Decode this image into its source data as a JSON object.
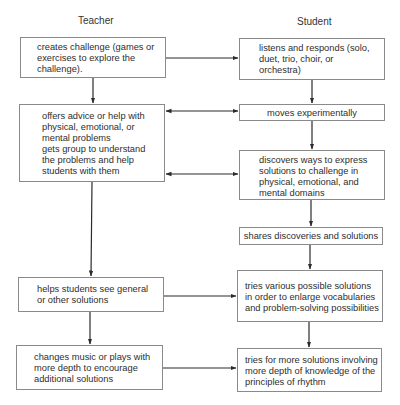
{
  "columns": {
    "teacher": "Teacher",
    "student": "Student"
  },
  "teacher_boxes": [
    {
      "id": "t1",
      "text": "creates challenge (games or\nexercises to explore the\nchallenge)."
    },
    {
      "id": "t2",
      "text": "offers advice or help with\nphysical, emotional, or\nmental problems\ngets group to understand\nthe problems and help\nstudents with them"
    },
    {
      "id": "t3",
      "text": "helps students see general\nor other solutions"
    },
    {
      "id": "t4",
      "text": "changes music or plays with\nmore depth to encourage\nadditional solutions"
    }
  ],
  "student_boxes": [
    {
      "id": "s1",
      "text": "listens and responds (solo,\nduet, trio, choir, or\norchestra)"
    },
    {
      "id": "s2",
      "text": "moves experimentally"
    },
    {
      "id": "s3",
      "text": "discovers ways to express\nsolutions to challenge in\nphysical, emotional, and\nmental domains"
    },
    {
      "id": "s4",
      "text": "shares discoveries and solutions"
    },
    {
      "id": "s5",
      "text": "tries various possible solutions\nin order to enlarge vocabularies\nand problem-solving possibilities"
    },
    {
      "id": "s6",
      "text": "tries for more solutions involving\nmore depth of knowledge of the\nprinciples of rhythm"
    }
  ],
  "connections": [
    {
      "from": "t1",
      "to": "t2",
      "type": "arrow"
    },
    {
      "from": "t2",
      "to": "t3",
      "type": "arrow"
    },
    {
      "from": "t3",
      "to": "t4",
      "type": "arrow"
    },
    {
      "from": "s1",
      "to": "s2",
      "type": "arrow"
    },
    {
      "from": "s2",
      "to": "s3",
      "type": "arrow"
    },
    {
      "from": "s3",
      "to": "s4",
      "type": "arrow"
    },
    {
      "from": "s4",
      "to": "s5",
      "type": "arrow"
    },
    {
      "from": "s5",
      "to": "s6",
      "type": "arrow"
    },
    {
      "from": "t1",
      "to": "s1",
      "type": "arrow"
    },
    {
      "from": "t2",
      "to": "s2",
      "type": "double-arrow"
    },
    {
      "from": "t2",
      "to": "s3",
      "type": "double-arrow"
    },
    {
      "from": "t3",
      "to": "s5",
      "type": "arrow"
    },
    {
      "from": "t4",
      "to": "s6",
      "type": "arrow"
    }
  ],
  "colors": {
    "line": "#2b2b2b",
    "box_border": "#8a8a8a",
    "text": "#2e2e2e"
  }
}
